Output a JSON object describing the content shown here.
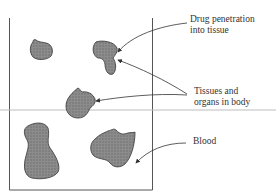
{
  "diagram": {
    "labels": {
      "drug_penetration_line1": "Drug penetration",
      "drug_penetration_line2": "into tissue",
      "tissues_line1": "Tissues and",
      "tissues_line2": "organs in body",
      "blood": "Blood"
    },
    "colors": {
      "tissue_fill": "#8a8a8a",
      "tissue_stroke": "#444444",
      "box_stroke": "#555555",
      "divider": "#bdbdbd"
    }
  }
}
